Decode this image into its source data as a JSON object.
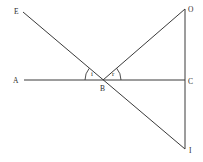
{
  "diagram": {
    "type": "geometry-reflection",
    "points": {
      "E": "E",
      "A": "A",
      "B": "B",
      "C": "C",
      "O": "O",
      "I": "I"
    },
    "angles": {
      "incidence": "i",
      "reflection": "r"
    },
    "segments": [
      "E-B",
      "B-I",
      "A-C",
      "B-O",
      "O-I"
    ]
  }
}
